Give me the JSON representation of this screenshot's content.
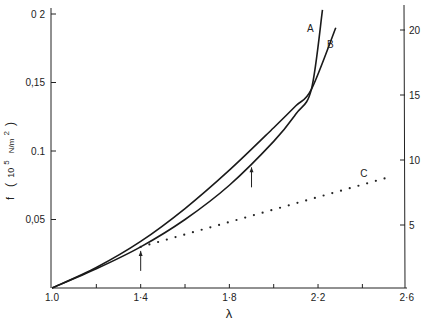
{
  "chart_data": {
    "type": "line",
    "title": "",
    "xlabel": "λ",
    "ylabel": "f",
    "ylabel_units_prefix": "10",
    "ylabel_units_exp": "5",
    "ylabel_units_unit": "N/m",
    "ylabel_units_unit_exp": "2",
    "xlim": [
      1.0,
      2.6
    ],
    "ylim_left": [
      0,
      0.2
    ],
    "ylim_right": [
      0,
      21.8
    ],
    "x_ticks": [
      1.0,
      1.2,
      1.4,
      1.6,
      1.8,
      2.0,
      2.2,
      2.4,
      2.6
    ],
    "x_tick_labels": [
      "1.0",
      "",
      "1.4",
      "",
      "1.8",
      "",
      "2.2",
      "",
      "2.6"
    ],
    "y_left_ticks": [
      0.05,
      0.1,
      0.15,
      0.2
    ],
    "y_left_tick_labels": [
      "0.05",
      "0.1",
      "0.15",
      "0.2"
    ],
    "y_right_ticks": [
      5,
      10,
      15,
      20
    ],
    "y_right_tick_labels": [
      "5",
      "10",
      "15",
      "20"
    ],
    "grid": false,
    "legend": "inline labels",
    "series": [
      {
        "name": "A",
        "style": "solid",
        "x": [
          1.0,
          1.2,
          1.4,
          1.6,
          1.8,
          2.0,
          2.1,
          2.17,
          2.22
        ],
        "y": [
          0.0,
          0.014,
          0.03,
          0.05,
          0.075,
          0.107,
          0.127,
          0.145,
          0.203
        ]
      },
      {
        "name": "B",
        "style": "solid",
        "x": [
          1.0,
          1.2,
          1.4,
          1.6,
          1.8,
          2.0,
          2.1,
          2.17,
          2.28
        ],
        "y": [
          0.0,
          0.015,
          0.034,
          0.058,
          0.086,
          0.117,
          0.133,
          0.145,
          0.19
        ]
      },
      {
        "name": "C",
        "style": "dotted",
        "x": [
          1.0,
          1.4,
          1.6,
          1.8,
          2.0,
          2.2,
          2.4,
          2.5
        ],
        "y": [
          0.0,
          0.03,
          0.039,
          0.048,
          0.057,
          0.066,
          0.075,
          0.08
        ]
      }
    ],
    "annotations": [
      {
        "type": "arrow",
        "direction": "up",
        "x": 1.4,
        "y": 0.03,
        "description": "arrow marking where curve C departs at λ≈1.4"
      },
      {
        "type": "arrow",
        "direction": "up",
        "x": 1.9,
        "y": 0.091,
        "description": "arrow on curve A at λ≈1.9"
      }
    ],
    "curve_labels": [
      {
        "text": "A",
        "x": 2.15,
        "y": 0.187
      },
      {
        "text": "B",
        "x": 2.24,
        "y": 0.175
      },
      {
        "text": "C",
        "x": 2.39,
        "y": 0.081
      }
    ]
  }
}
